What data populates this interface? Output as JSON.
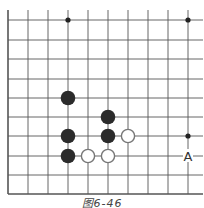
{
  "figure": {
    "caption": "图6-46",
    "colors": {
      "grid": "#555555",
      "black_stone": "#2b2b2b",
      "white_stone_fill": "#ffffff",
      "white_stone_stroke": "#777777",
      "star_point": "#222222",
      "label": "#333333"
    }
  },
  "board": {
    "visible_columns": 10,
    "visible_rows": 10,
    "edges": [
      "left",
      "bottom"
    ],
    "grid_x": [
      8,
      28,
      48,
      68,
      88,
      108,
      128,
      148,
      168,
      188
    ],
    "grid_y": [
      20,
      40,
      59,
      79,
      98,
      117,
      136,
      156,
      175,
      194
    ],
    "star_points": [
      {
        "col": 3,
        "row": 0
      },
      {
        "col": 9,
        "row": 0
      },
      {
        "col": 9,
        "row": 6
      }
    ],
    "stones": [
      {
        "color": "black",
        "col": 3,
        "row": 4
      },
      {
        "color": "black",
        "col": 5,
        "row": 5
      },
      {
        "color": "black",
        "col": 3,
        "row": 6
      },
      {
        "color": "black",
        "col": 5,
        "row": 6
      },
      {
        "color": "white",
        "col": 6,
        "row": 6
      },
      {
        "color": "black",
        "col": 3,
        "row": 7
      },
      {
        "color": "white",
        "col": 4,
        "row": 7
      },
      {
        "color": "white",
        "col": 5,
        "row": 7
      }
    ],
    "labels": [
      {
        "text": "A",
        "col": 9,
        "row": 7
      }
    ]
  }
}
